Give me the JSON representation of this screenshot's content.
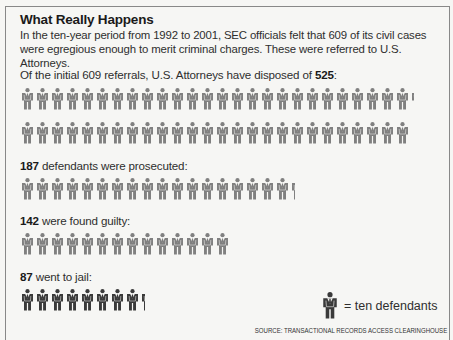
{
  "title": "What Really Happens",
  "intro": "In the ten-year period from 1992 to 2001, SEC officials felt that 609 of its civil cases were egregious enough to merit criminal charges. These were referred to U.S. Attorneys.",
  "sections": [
    {
      "prefix": "Of the initial 609 referrals, U.S. Attorneys have disposed of ",
      "value": "525",
      "suffix": ":"
    },
    {
      "prefix": "",
      "value": "187",
      "suffix": " defendants were prosecuted:"
    },
    {
      "prefix": "",
      "value": "142",
      "suffix": " were found guilty:"
    },
    {
      "prefix": "",
      "value": "87",
      "suffix": " went to jail:"
    }
  ],
  "legend": {
    "icon": "person-icon",
    "text": "= ten defendants"
  },
  "source": "SOURCE: TRANSACTIONAL RECORDS ACCESS CLEARINGHOUSE",
  "colors": {
    "figure": "#808080",
    "figure_dark": "#3a3a3a"
  },
  "chart_data": {
    "type": "pictogram",
    "title": "What Really Happens",
    "unit": "ten defendants per icon",
    "categories": [
      "Disposed of by U.S. Attorneys",
      "Prosecuted",
      "Found guilty",
      "Went to jail"
    ],
    "values": [
      525,
      187,
      142,
      87
    ],
    "total_referrals": 609,
    "period": "1992 to 2001",
    "source": "Transactional Records Access Clearinghouse"
  }
}
